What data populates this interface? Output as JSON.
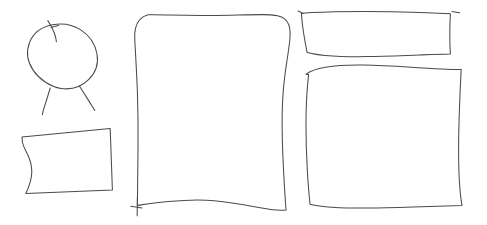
{
  "canvas": {
    "width": 487,
    "height": 225,
    "background_color": "#ffffff",
    "medium": "hand-drawn line sketch",
    "stroke_color": "#4a4a52",
    "stroke_width": 1.05,
    "stroke_color_light": "#6d6d75"
  },
  "shapes": [
    {
      "id": "ellipse-figure",
      "name": "ellipse-with-legs",
      "description": "tilted oval outline with small stem tick at upper-left and two thin angled legs below",
      "bounds": {
        "x": 26,
        "y": 16,
        "width": 74,
        "height": 100
      },
      "stroke_color": "#4a4a52",
      "stroke_width": 1.05,
      "paths": {
        "body": "M 52.5 24.8 C 41.5 27.0 33.0 33.6 29.6 42.4 C 26.0 51.6 27.6 62.2 33.4 70.6 C 39.6 79.6 50.2 86.6 61.0 88.4 C 71.4 90.1 81.6 86.4 88.6 79.6 C 95.6 72.8 98.6 63.2 97.0 54.0 C 95.3 44.2 89.2 35.2 80.4 29.6 C 72.2 24.4 61.8 22.9 52.5 24.8 Z",
        "stem": "M 47.8 20.6 C 50.2 24.0 52.6 28.4 54.4 33.2 C 55.6 36.4 56.2 39.2 56.4 41.8",
        "stem_cross": "M 58.6 25.4 C 56.0 25.9 53.4 26.5 51.0 27.6",
        "leg_left": "M 50.2 88.0 C 48.2 95.0 46.0 101.6 44.2 107.4 C 43.2 110.6 42.6 112.9 42.4 114.6",
        "leg_right": "M 79.4 86.0 C 83.2 92.0 87.0 98.0 90.4 103.4 C 92.4 106.6 93.8 108.9 94.8 110.4"
      }
    },
    {
      "id": "quad-bowed",
      "name": "tilted-quadrilateral",
      "description": "slanted four-sided shape with concave bowed left edge",
      "bounds": {
        "x": 19,
        "y": 126,
        "width": 92,
        "height": 68
      },
      "stroke_color": "#4a4a52",
      "stroke_width": 1.05,
      "paths": {
        "outline": "M 22.0 137.0 L 110.2 128.6 L 112.4 190.0 L 25.8 193.4 C 29.4 186.0 31.6 179.0 31.8 172.2 C 32.0 165.0 29.6 157.6 25.6 150.4 C 24.2 147.8 23.0 145.0 22.4 142.0 Z"
      }
    },
    {
      "id": "rect-center-large",
      "name": "large-rounded-rectangle-center",
      "description": "tall rounded rectangle, wavy right edge, left edge overshoots bottom forming a cross tail",
      "bounds": {
        "x": 130,
        "y": 11,
        "width": 162,
        "height": 205
      },
      "stroke_color": "#4a4a52",
      "stroke_width": 1.05,
      "paths": {
        "outline": "M 148.0 14.8 C 141.4 16.6 137.0 21.6 135.4 28.6 C 134.6 32.2 134.6 36.0 134.8 39.8 C 135.6 56.4 136.8 74.0 137.4 92.0 C 138.0 110.4 138.2 129.2 138.0 147.4 C 137.9 161.2 137.7 174.4 137.6 186.4 C 137.5 194.6 137.4 201.0 137.4 205.4 C 148.0 204.0 158.4 202.6 168.6 201.6 C 181.6 200.3 194.2 199.6 206.2 200.2 C 219.0 200.8 231.0 202.6 242.0 204.6 C 252.6 206.5 262.2 208.4 270.4 209.4 C 276.8 210.2 282.0 210.4 286.0 210.0 C 285.2 198.4 284.4 186.8 283.8 175.2 C 283.0 160.4 282.4 145.6 282.2 131.2 C 282.0 118.4 282.2 106.0 283.0 94.6 C 283.8 83.0 285.2 72.4 286.6 63.2 C 288.0 54.0 289.2 46.2 289.8 40.0 C 290.4 33.6 290.2 28.6 288.8 24.8 C 287.0 20.0 283.2 17.0 277.6 15.8 C 273.4 14.9 268.2 14.6 262.4 14.6 C 249.0 14.6 232.8 15.2 216.4 15.4 C 199.4 15.6 182.4 15.4 168.0 15.0 C 160.8 14.8 154.2 14.6 148.0 14.8 Z",
        "tail_overshoot": "M 137.4 197.0 C 137.3 203.0 137.3 208.4 137.2 212.2 C 137.2 214.0 137.2 215.2 137.2 215.8",
        "tail_cross": "M 130.8 206.2 C 134.6 206.8 138.4 207.4 142.0 208.0"
      }
    },
    {
      "id": "rect-topright-flat",
      "name": "flat-wide-rectangle-top-right",
      "description": "short wide rectangle, right edge slants inward, small overshoot ticks at top corners",
      "bounds": {
        "x": 297,
        "y": 9,
        "width": 163,
        "height": 52
      },
      "stroke_color": "#4a4a52",
      "stroke_width": 1.05,
      "paths": {
        "outline": "M 301.4 13.6 C 304.0 13.2 307.4 12.9 311.4 12.6 C 325.0 11.8 344.0 11.4 363.4 11.4 C 383.6 11.4 404.0 11.8 420.4 12.4 C 433.0 12.9 443.4 13.4 450.4 13.8 C 450.0 20.6 449.8 27.6 449.8 34.2 C 449.8 41.4 450.0 48.2 450.4 54.0 C 441.0 54.2 430.4 54.6 419.4 55.0 C 402.0 55.6 383.6 56.4 367.0 56.6 C 351.0 56.8 336.6 56.4 325.4 55.4 C 317.6 54.7 311.4 53.6 307.0 52.2 C 305.8 45.8 304.6 39.2 303.6 33.0 C 302.6 26.6 301.8 20.2 301.4 13.6 Z",
        "tick_topleft": "M 298.2 11.0 C 300.0 11.8 301.8 12.6 303.4 13.4",
        "tick_topright": "M 452.0 11.6 C 454.8 12.0 457.4 12.4 459.6 12.8"
      }
    },
    {
      "id": "rect-bottomright-large",
      "name": "large-rounded-rectangle-bottom-right",
      "description": "large rounded rectangle with wavy top edge and sharp angled bottom-right corner",
      "bounds": {
        "x": 302,
        "y": 62,
        "width": 166,
        "height": 150
      },
      "stroke_color": "#4a4a52",
      "stroke_width": 1.05,
      "paths": {
        "outline": "M 306.0 74.2 C 310.4 70.8 317.0 68.6 325.4 67.2 C 336.0 65.4 349.2 64.8 363.2 65.0 C 379.0 65.2 395.6 66.2 411.0 67.2 C 424.2 68.0 436.4 68.8 446.4 69.2 C 452.6 69.5 457.6 69.6 461.2 69.4 C 460.6 81.0 460.0 93.0 459.6 105.0 C 459.0 120.4 458.6 135.8 458.6 150.2 C 458.6 163.0 458.9 174.8 459.6 184.8 C 460.2 193.2 461.0 200.2 462.0 205.4 C 452.0 205.8 441.0 206.2 429.6 206.6 C 412.0 207.2 393.6 207.8 376.4 208.0 C 359.8 208.2 344.4 208.0 331.8 207.2 C 322.8 206.6 315.4 205.6 310.0 204.2 C 308.8 192.2 307.8 180.0 307.2 168.0 C 306.4 153.4 306.0 139.0 306.0 125.4 C 306.0 113.4 306.3 102.2 307.0 92.4 C 307.4 85.8 308.0 79.8 308.6 74.6 C 307.8 74.5 306.9 74.4 306.0 74.2 Z"
      }
    }
  ]
}
